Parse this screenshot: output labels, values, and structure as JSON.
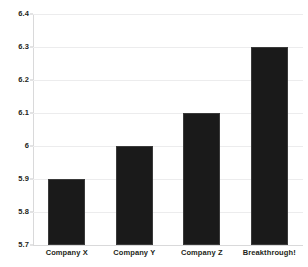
{
  "chart_data": {
    "type": "bar",
    "title": "",
    "subtitle": "",
    "xlabel": "",
    "ylabel": "",
    "categories": [
      "Company X",
      "Company Y",
      "Company Z",
      "Breakthrough!"
    ],
    "values": [
      5.9,
      6.0,
      6.1,
      6.3
    ],
    "series": [
      {
        "name": "",
        "values": [
          5.9,
          6.0,
          6.1,
          6.3
        ]
      }
    ],
    "ylim": [
      5.7,
      6.4
    ],
    "ytick_labels": [
      "6.4",
      "6.3",
      "6.2",
      "6.1",
      "6",
      "5.9",
      "5.8",
      "5.7"
    ],
    "ytick_values": [
      6.4,
      6.3,
      6.2,
      6.1,
      6.0,
      5.9,
      5.8,
      5.7
    ],
    "grid": "horizontal",
    "legend": "none",
    "bar_color": "#1a1a1a",
    "gridline_color": "#ececed",
    "axis_color": "#d9d9da",
    "label_color": "#231f20",
    "background_color": "#ffffff"
  }
}
